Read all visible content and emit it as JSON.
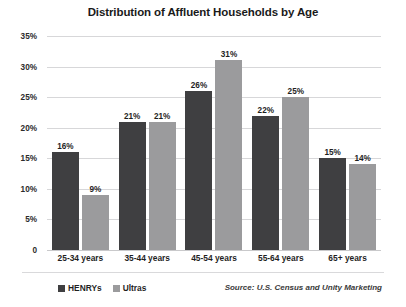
{
  "chart_data": {
    "type": "bar",
    "title": "Distribution of Affluent Households by Age",
    "xlabel": "",
    "ylabel": "",
    "ylim": [
      0,
      35
    ],
    "ytick_labels": [
      "0",
      "5%",
      "10%",
      "15%",
      "20%",
      "25%",
      "30%",
      "35%"
    ],
    "ytick_values": [
      0,
      5,
      10,
      15,
      20,
      25,
      30,
      35
    ],
    "grid": true,
    "legend_position": "bottom-left",
    "categories": [
      "25-34 years",
      "35-44 years",
      "45-54 years",
      "55-64 years",
      "65+ years"
    ],
    "series": [
      {
        "name": "HENRYs",
        "color": "#3f3f41",
        "values": [
          16,
          21,
          26,
          22,
          15
        ],
        "labels": [
          "16%",
          "21%",
          "26%",
          "22%",
          "15%"
        ]
      },
      {
        "name": "Ultras",
        "color": "#9b9b9d",
        "values": [
          9,
          21,
          31,
          25,
          14
        ],
        "labels": [
          "9%",
          "21%",
          "31%",
          "25%",
          "14%"
        ]
      }
    ],
    "annotations": [
      "Source: U.S. Census and Unity Marketing"
    ]
  },
  "footer": {
    "source": "Source: U.S. Census and Unity Marketing"
  },
  "colors": {
    "henrys": "#3f3f41",
    "ultras": "#9b9b9d",
    "gridline": "#d7d7d9",
    "text": "#1f1f1f",
    "background": "#ffffff"
  }
}
